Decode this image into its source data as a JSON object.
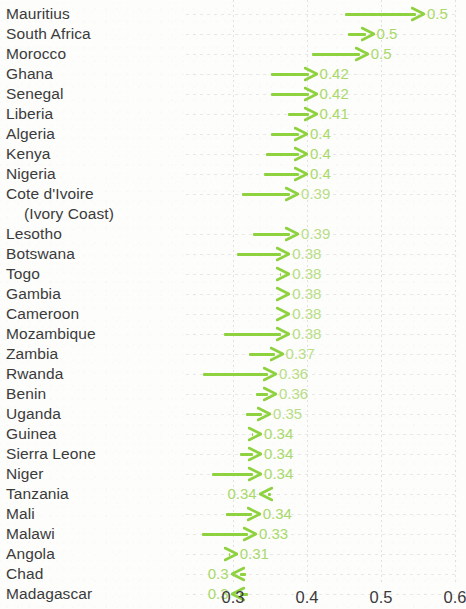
{
  "chart_data": {
    "type": "bar",
    "title": "",
    "subtitle": "",
    "xlabel": "",
    "ylabel": "",
    "xlim": [
      0.27,
      0.62
    ],
    "xticks": [
      0.3,
      0.4,
      0.5,
      0.6
    ],
    "xtick_labels": [
      "0.3",
      "0.4",
      "0.5",
      "0.6"
    ],
    "grid": true,
    "legend": "none",
    "annotation": "Arrows run from a starting value to an ending value; the printed number marks the arrow tip. Most arrows point right (increase); Tanzania, Chad and Madagascar point left (decrease).",
    "categories": [
      "Mauritius",
      "South Africa",
      "Morocco",
      "Ghana",
      "Senegal",
      "Liberia",
      "Algeria",
      "Kenya",
      "Nigeria",
      "Cote d'Ivoire (Ivory Coast)",
      "Lesotho",
      "Botswana",
      "Togo",
      "Gambia",
      "Cameroon",
      "Mozambique",
      "Zambia",
      "Rwanda",
      "Benin",
      "Uganda",
      "Guinea",
      "Sierra Leone",
      "Niger",
      "Tanzania",
      "Mali",
      "Malawi",
      "Angola",
      "Chad",
      "Madagascar"
    ],
    "values": [
      0.5,
      0.5,
      0.5,
      0.42,
      0.42,
      0.41,
      0.4,
      0.4,
      0.4,
      0.39,
      0.39,
      0.38,
      0.38,
      0.38,
      0.38,
      0.38,
      0.37,
      0.36,
      0.36,
      0.35,
      0.34,
      0.34,
      0.34,
      0.34,
      0.34,
      0.33,
      0.31,
      0.3,
      0.3
    ],
    "rows": [
      {
        "label": "Mauritius",
        "label2": "",
        "value": 0.5,
        "value_text": "0.5",
        "start": 0.452,
        "end": 0.558,
        "direction": "right"
      },
      {
        "label": "South Africa",
        "label2": "",
        "value": 0.5,
        "value_text": "0.5",
        "start": 0.455,
        "end": 0.49,
        "direction": "right"
      },
      {
        "label": "Morocco",
        "label2": "",
        "value": 0.5,
        "value_text": "0.5",
        "start": 0.407,
        "end": 0.482,
        "direction": "right"
      },
      {
        "label": "Ghana",
        "label2": "",
        "value": 0.42,
        "value_text": "0.42",
        "start": 0.352,
        "end": 0.413,
        "direction": "right"
      },
      {
        "label": "Senegal",
        "label2": "",
        "value": 0.42,
        "value_text": "0.42",
        "start": 0.351,
        "end": 0.413,
        "direction": "right"
      },
      {
        "label": "Liberia",
        "label2": "",
        "value": 0.41,
        "value_text": "0.41",
        "start": 0.374,
        "end": 0.413,
        "direction": "right"
      },
      {
        "label": "Algeria",
        "label2": "",
        "value": 0.4,
        "value_text": "0.4",
        "start": 0.352,
        "end": 0.4,
        "direction": "right"
      },
      {
        "label": "Kenya",
        "label2": "",
        "value": 0.4,
        "value_text": "0.4",
        "start": 0.345,
        "end": 0.4,
        "direction": "right"
      },
      {
        "label": "Nigeria",
        "label2": "",
        "value": 0.4,
        "value_text": "0.4",
        "start": 0.342,
        "end": 0.4,
        "direction": "right"
      },
      {
        "label": "Cote d'Ivoire",
        "label2": "(Ivory Coast)",
        "value": 0.39,
        "value_text": "0.39",
        "start": 0.312,
        "end": 0.388,
        "direction": "right"
      },
      {
        "label": "Lesotho",
        "label2": "",
        "value": 0.39,
        "value_text": "0.39",
        "start": 0.327,
        "end": 0.388,
        "direction": "right"
      },
      {
        "label": "Botswana",
        "label2": "",
        "value": 0.38,
        "value_text": "0.38",
        "start": 0.306,
        "end": 0.376,
        "direction": "right"
      },
      {
        "label": "Togo",
        "label2": "",
        "value": 0.38,
        "value_text": "0.38",
        "start": 0.364,
        "end": 0.376,
        "direction": "right"
      },
      {
        "label": "Gambia",
        "label2": "",
        "value": 0.38,
        "value_text": "0.38",
        "start": 0.368,
        "end": 0.376,
        "direction": "right"
      },
      {
        "label": "Cameroon",
        "label2": "",
        "value": 0.38,
        "value_text": "0.38",
        "start": 0.368,
        "end": 0.376,
        "direction": "right"
      },
      {
        "label": "Mozambique",
        "label2": "",
        "value": 0.38,
        "value_text": "0.38",
        "start": 0.288,
        "end": 0.376,
        "direction": "right"
      },
      {
        "label": "Zambia",
        "label2": "",
        "value": 0.37,
        "value_text": "0.37",
        "start": 0.322,
        "end": 0.367,
        "direction": "right"
      },
      {
        "label": "Rwanda",
        "label2": "",
        "value": 0.36,
        "value_text": "0.36",
        "start": 0.259,
        "end": 0.358,
        "direction": "right"
      },
      {
        "label": "Benin",
        "label2": "",
        "value": 0.36,
        "value_text": "0.36",
        "start": 0.331,
        "end": 0.358,
        "direction": "right"
      },
      {
        "label": "Uganda",
        "label2": "",
        "value": 0.35,
        "value_text": "0.35",
        "start": 0.318,
        "end": 0.35,
        "direction": "right"
      },
      {
        "label": "Guinea",
        "label2": "",
        "value": 0.34,
        "value_text": "0.34",
        "start": 0.326,
        "end": 0.338,
        "direction": "right"
      },
      {
        "label": "Sierra Leone",
        "label2": "",
        "value": 0.34,
        "value_text": "0.34",
        "start": 0.31,
        "end": 0.338,
        "direction": "right"
      },
      {
        "label": "Niger",
        "label2": "",
        "value": 0.34,
        "value_text": "0.34",
        "start": 0.272,
        "end": 0.338,
        "direction": "right"
      },
      {
        "label": "Tanzania",
        "label2": "",
        "value": 0.34,
        "value_text": "0.34",
        "start": 0.352,
        "end": 0.336,
        "direction": "left"
      },
      {
        "label": "Mali",
        "label2": "",
        "value": 0.34,
        "value_text": "0.34",
        "start": 0.29,
        "end": 0.336,
        "direction": "right"
      },
      {
        "label": "Malawi",
        "label2": "",
        "value": 0.33,
        "value_text": "0.33",
        "start": 0.258,
        "end": 0.331,
        "direction": "right"
      },
      {
        "label": "Angola",
        "label2": "",
        "value": 0.31,
        "value_text": "0.31",
        "start": 0.294,
        "end": 0.305,
        "direction": "right"
      },
      {
        "label": "Chad",
        "label2": "",
        "value": 0.3,
        "value_text": "0.3",
        "start": 0.318,
        "end": 0.298,
        "direction": "left"
      },
      {
        "label": "Madagascar",
        "label2": "",
        "value": 0.3,
        "value_text": "0.3",
        "start": 0.32,
        "end": 0.298,
        "direction": "left"
      }
    ],
    "colors": {
      "arrow": "#8fd23f",
      "value_text": "#a9d96a",
      "label_text": "#3b3b3b",
      "grid": "#d9d9d9",
      "background": "#fdfdfb"
    }
  }
}
